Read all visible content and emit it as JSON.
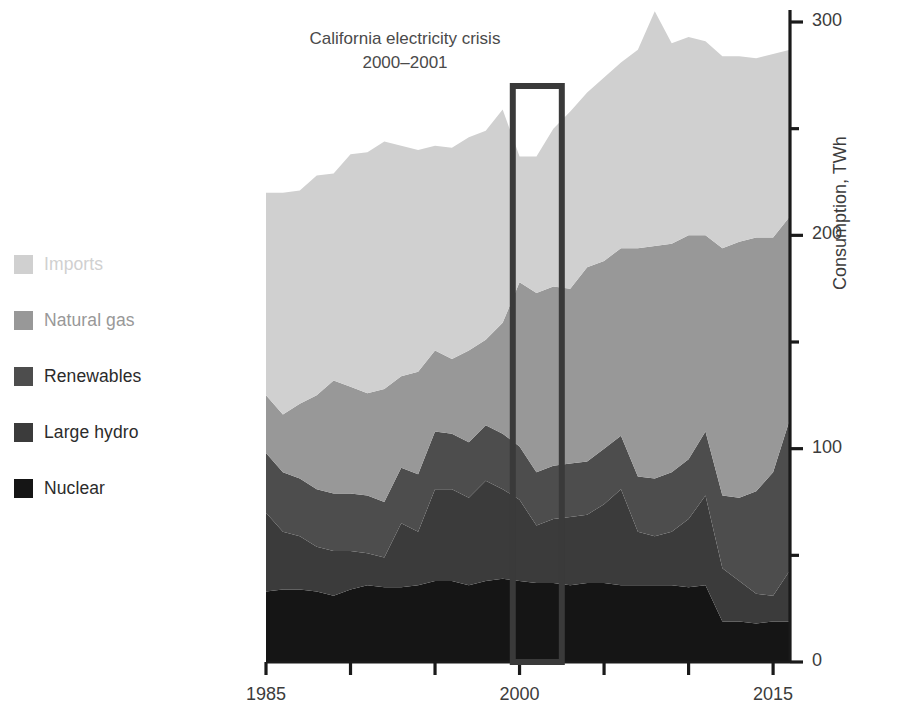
{
  "chart_data": {
    "type": "area",
    "stacked": true,
    "title": "",
    "xlabel": "",
    "ylabel": "Consumption, TWh",
    "xlim": [
      1985,
      2016
    ],
    "ylim": [
      0,
      310
    ],
    "yaxis_position": "right",
    "grid": false,
    "legend_position": "left",
    "y_ticks_major": [
      0,
      100,
      200,
      300
    ],
    "y_ticks_major_labels": [
      "0",
      "100",
      "200",
      "300"
    ],
    "y_ticks_minor": [
      50,
      150,
      250
    ],
    "x_ticks": [
      1985,
      1990,
      1995,
      2000,
      2005,
      2010,
      2015
    ],
    "x_tick_labels": [
      "1985",
      "",
      "",
      "2000",
      "",
      "",
      "2015"
    ],
    "x": [
      1985,
      1986,
      1987,
      1988,
      1989,
      1990,
      1991,
      1992,
      1993,
      1994,
      1995,
      1996,
      1997,
      1998,
      1999,
      2000,
      2001,
      2002,
      2003,
      2004,
      2005,
      2006,
      2007,
      2008,
      2009,
      2010,
      2011,
      2012,
      2013,
      2014,
      2015,
      2016
    ],
    "series": [
      {
        "name": "Nuclear",
        "color": "#151515",
        "values": [
          33,
          34,
          34,
          33,
          31,
          34,
          36,
          35,
          35,
          36,
          38,
          38,
          36,
          38,
          39,
          38,
          37,
          37,
          36,
          37,
          37,
          36,
          36,
          36,
          36,
          35,
          36,
          19,
          19,
          18,
          19,
          19
        ]
      },
      {
        "name": "Large hydro",
        "color": "#3b3b3b",
        "values": [
          37,
          27,
          25,
          21,
          21,
          18,
          15,
          14,
          30,
          25,
          43,
          43,
          41,
          47,
          42,
          38,
          27,
          30,
          32,
          32,
          37,
          45,
          25,
          23,
          25,
          32,
          42,
          25,
          19,
          14,
          12,
          24
        ]
      },
      {
        "name": "Renewables",
        "color": "#4d4d4d",
        "values": [
          28,
          28,
          27,
          27,
          27,
          27,
          27,
          26,
          26,
          27,
          27,
          26,
          26,
          26,
          26,
          25,
          25,
          25,
          25,
          25,
          26,
          25,
          26,
          27,
          28,
          28,
          30,
          34,
          39,
          48,
          58,
          71
        ]
      },
      {
        "name": "Natural gas",
        "color": "#989898",
        "values": [
          27,
          27,
          35,
          44,
          53,
          50,
          48,
          53,
          43,
          48,
          38,
          35,
          43,
          40,
          52,
          77,
          84,
          84,
          82,
          91,
          88,
          88,
          107,
          109,
          107,
          105,
          92,
          116,
          120,
          119,
          110,
          95
        ]
      },
      {
        "name": "Imports",
        "color": "#d0d0d0",
        "values": [
          95,
          104,
          100,
          103,
          97,
          109,
          113,
          116,
          108,
          104,
          96,
          99,
          100,
          98,
          100,
          59,
          64,
          74,
          83,
          82,
          86,
          87,
          93,
          110,
          94,
          93,
          91,
          90,
          87,
          84,
          86,
          78
        ]
      }
    ],
    "annotations": [
      {
        "name": "california-electricity-crisis",
        "text": "California electricity crisis\n2000–2001",
        "highlight_box": {
          "x_start": 1999.6,
          "x_end": 2002.5,
          "y_start": 0,
          "y_end": 270,
          "color": "#3a3a3a"
        }
      }
    ]
  },
  "legend": {
    "items": [
      {
        "label": "Imports",
        "color": "#d0d0d0"
      },
      {
        "label": "Natural gas",
        "color": "#989898"
      },
      {
        "label": "Renewables",
        "color": "#4d4d4d"
      },
      {
        "label": "Large hydro",
        "color": "#3b3b3b"
      },
      {
        "label": "Nuclear",
        "color": "#151515"
      }
    ]
  },
  "axes": {
    "y_label": "Consumption, TWh",
    "y_tick_labels": [
      "300",
      "200",
      "100",
      "0"
    ],
    "x_tick_labels": [
      "1985",
      "2000",
      "2015"
    ]
  },
  "annotation": {
    "line1": "California electricity crisis",
    "line2": "2000–2001"
  }
}
